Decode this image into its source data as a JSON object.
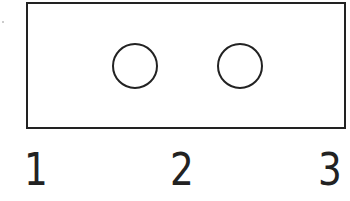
{
  "diagram": {
    "shape": "rectangle with two circular holes",
    "holes": [
      {
        "id": "hole-left",
        "cx": 136,
        "cy": 65,
        "r": 23
      },
      {
        "id": "hole-right",
        "cx": 241,
        "cy": 65,
        "r": 23
      }
    ],
    "labels": [
      "1",
      "2",
      "3"
    ],
    "stroke_color": "#222222"
  }
}
